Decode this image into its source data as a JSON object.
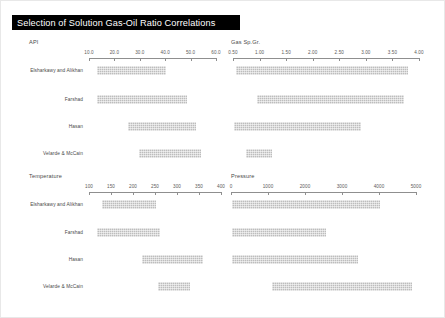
{
  "document": {
    "title": "Selection of Solution Gas-Oil Ratio Correlations"
  },
  "correlations": [
    "Elsharkawy and Alikhan",
    "Farshad",
    "Hasan",
    "Velarde & McCain"
  ],
  "chart_data": [
    {
      "type": "bar",
      "orientation": "horizontal",
      "title": "API",
      "xlabel": "API",
      "ylabel": "",
      "grid": false,
      "legend": "none",
      "xlim": [
        10.0,
        60.0
      ],
      "ticks": [
        10.0,
        20.0,
        30.0,
        40.0,
        50.0,
        60.0
      ],
      "tick_labels": [
        "10.0",
        "20.0",
        "30.0",
        "40.0",
        "50.0",
        "60.0"
      ],
      "categories": [
        "Elsharkawy and Alikhan",
        "Farshad",
        "Hasan",
        "Velarde & McCain"
      ],
      "ranges": [
        {
          "category": "Elsharkawy and Alikhan",
          "start": 13.0,
          "end": 40.5
        },
        {
          "category": "Farshad",
          "start": 13.0,
          "end": 48.5
        },
        {
          "category": "Hasan",
          "start": 25.5,
          "end": 52.0
        },
        {
          "category": "Velarde & McCain",
          "start": 29.5,
          "end": 54.0
        }
      ]
    },
    {
      "type": "bar",
      "orientation": "horizontal",
      "title": "Gas Sp.Gr.",
      "xlabel": "Gas Sp.Gr.",
      "ylabel": "",
      "grid": false,
      "legend": "none",
      "xlim": [
        0.5,
        4.0
      ],
      "ticks": [
        0.5,
        1.0,
        1.5,
        2.0,
        2.5,
        3.0,
        3.5,
        4.0
      ],
      "tick_labels": [
        "0.50",
        "1.00",
        "1.50",
        "2.00",
        "2.50",
        "3.00",
        "3.50",
        "4.00"
      ],
      "categories": [
        "Elsharkawy and Alikhan",
        "Farshad",
        "Hasan",
        "Velarde & McCain"
      ],
      "ranges": [
        {
          "category": "Elsharkawy and Alikhan",
          "start": 0.55,
          "end": 3.8
        },
        {
          "category": "Farshad",
          "start": 0.95,
          "end": 3.72
        },
        {
          "category": "Hasan",
          "start": 0.52,
          "end": 2.9
        },
        {
          "category": "Velarde & McCain",
          "start": 0.74,
          "end": 1.23
        }
      ]
    },
    {
      "type": "bar",
      "orientation": "horizontal",
      "title": "Temperature",
      "xlabel": "Temperature",
      "ylabel": "",
      "grid": false,
      "legend": "none",
      "xlim": [
        100,
        400
      ],
      "ticks": [
        100,
        150,
        200,
        250,
        300,
        350,
        400
      ],
      "tick_labels": [
        "100",
        "150",
        "200",
        "250",
        "300",
        "350",
        "400"
      ],
      "categories": [
        "Elsharkawy and Alikhan",
        "Farshad",
        "Hasan",
        "Velarde & McCain"
      ],
      "ranges": [
        {
          "category": "Elsharkawy and Alikhan",
          "start": 130,
          "end": 253
        },
        {
          "category": "Farshad",
          "start": 118,
          "end": 262
        },
        {
          "category": "Hasan",
          "start": 220,
          "end": 358
        },
        {
          "category": "Velarde & McCain",
          "start": 256,
          "end": 330
        }
      ]
    },
    {
      "type": "bar",
      "orientation": "horizontal",
      "title": "Pressure",
      "xlabel": "Pressure",
      "ylabel": "",
      "grid": false,
      "legend": "none",
      "xlim": [
        0,
        5000
      ],
      "ticks": [
        0,
        1000,
        2000,
        3000,
        4000,
        5000
      ],
      "tick_labels": [
        "0",
        "1000",
        "2000",
        "3000",
        "4000",
        "5000"
      ],
      "categories": [
        "Elsharkawy and Alikhan",
        "Farshad",
        "Hasan",
        "Velarde & McCain"
      ],
      "ranges": [
        {
          "category": "Elsharkawy and Alikhan",
          "start": 40,
          "end": 4020
        },
        {
          "category": "Farshad",
          "start": 30,
          "end": 2580
        },
        {
          "category": "Hasan",
          "start": 30,
          "end": 3420
        },
        {
          "category": "Velarde & McCain",
          "start": 1100,
          "end": 4900
        }
      ]
    }
  ]
}
